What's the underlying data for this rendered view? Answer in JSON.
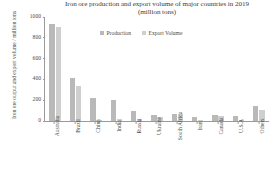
{
  "chart_data": {
    "type": "bar",
    "title": "Iron ore production and export volume of major countries in 2019 (million tons)",
    "title_lines": [
      "Iron ore production and export volume of major countries in 2019",
      "(million tons)"
    ],
    "xlabel": "",
    "ylabel": "Iron ore output and export volume / million tons",
    "ylim": [
      0,
      1000
    ],
    "yticks": [
      0,
      200,
      400,
      600,
      800,
      1000
    ],
    "ytick_labels": [
      "0",
      "200",
      "400",
      "600",
      "800",
      "1000"
    ],
    "grid": false,
    "legend_position": "top-center",
    "categories": [
      "Australia",
      "Brazil",
      "China",
      "India",
      "Russia",
      "Ukraine",
      "South Africa",
      "Iran",
      "Canada",
      "U.S.A",
      "Others"
    ],
    "series": [
      {
        "name": "Production",
        "color": "#b9b9b9",
        "values": [
          930,
          410,
          220,
          205,
          99,
          62,
          71,
          38,
          54,
          48,
          140
        ]
      },
      {
        "name": "Export Volume",
        "color": "#cfcfcf",
        "values": [
          900,
          340,
          5,
          22,
          23,
          39,
          66,
          6,
          47,
          8,
          110
        ]
      }
    ]
  },
  "legend": {
    "entries": [
      {
        "label": "Production",
        "color": "#b9b9b9"
      },
      {
        "label": "Export Volume",
        "color": "#cfcfcf"
      }
    ]
  }
}
